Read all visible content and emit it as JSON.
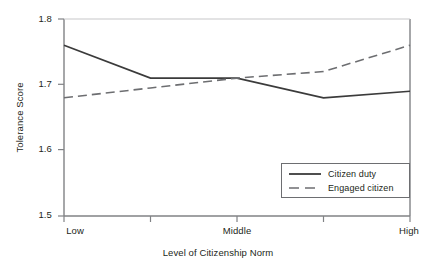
{
  "chart_data": {
    "type": "line",
    "title": "",
    "xlabel": "Level of Citizenship Norm",
    "ylabel": "Tolerance Score",
    "categories": [
      "Low",
      "",
      "Middle",
      "",
      "High"
    ],
    "x_tick_labels": [
      "Low",
      "Middle",
      "High"
    ],
    "y_tick_labels": [
      "1.5",
      "1.6",
      "1.7",
      "1.8"
    ],
    "y_ticks": [
      1.5,
      1.6,
      1.7,
      1.8
    ],
    "ylim": [
      1.5,
      1.8
    ],
    "xlim": [
      0,
      4
    ],
    "grid": false,
    "legend_position": "inside-bottom-right",
    "series": [
      {
        "name": "Citizen duty",
        "style": "solid",
        "color": "#3b3b3b",
        "values": [
          1.76,
          1.71,
          1.71,
          1.68,
          1.69
        ]
      },
      {
        "name": "Engaged citizen",
        "style": "dashed",
        "color": "#6d6e71",
        "values": [
          1.68,
          1.695,
          1.71,
          1.72,
          1.76
        ]
      }
    ]
  },
  "axes": {
    "y_label": "Tolerance Score",
    "x_label": "Level of Citizenship Norm",
    "y_tick_0": "1.5",
    "y_tick_1": "1.6",
    "y_tick_2": "1.7",
    "y_tick_3": "1.8",
    "x_tick_0": "Low",
    "x_tick_1": "Middle",
    "x_tick_2": "High"
  },
  "legend": {
    "items": [
      {
        "label": "Citizen duty",
        "style": "solid"
      },
      {
        "label": "Engaged citizen",
        "style": "dashed"
      }
    ]
  },
  "colors": {
    "axis": "#808285",
    "series_solid": "#3b3b3b",
    "series_dashed": "#6d6e71",
    "text": "#231f20",
    "background": "#ffffff"
  }
}
